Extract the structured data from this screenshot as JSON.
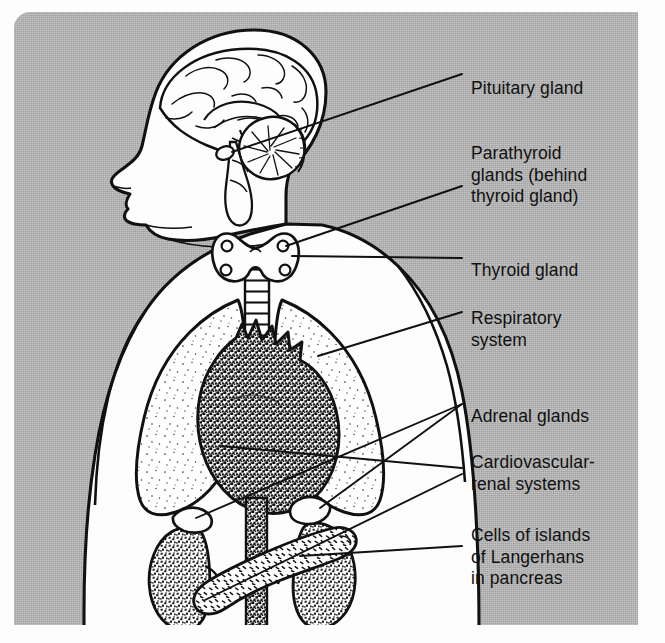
{
  "figure": {
    "panel_color": "#b2b2b2",
    "ink_color": "#101010",
    "paper_color": "#fdfdfd"
  },
  "labels": [
    {
      "id": "pituitary",
      "name": "pituitary-gland-label",
      "lines": [
        "Pituitary gland"
      ],
      "x": 471,
      "y": 78
    },
    {
      "id": "parathyroid",
      "name": "parathyroid-glands-label",
      "lines": [
        "Parathyroid",
        "glands (behind",
        "thyroid gland)"
      ],
      "x": 471,
      "y": 143
    },
    {
      "id": "thyroid",
      "name": "thyroid-gland-label",
      "lines": [
        "Thyroid gland"
      ],
      "x": 471,
      "y": 260
    },
    {
      "id": "respiratory",
      "name": "respiratory-system-label",
      "lines": [
        "Respiratory",
        "system"
      ],
      "x": 471,
      "y": 308
    },
    {
      "id": "adrenal",
      "name": "adrenal-glands-label",
      "lines": [
        "Adrenal glands"
      ],
      "x": 471,
      "y": 406
    },
    {
      "id": "cardiorenal",
      "name": "cardiovascular-renal-label",
      "lines": [
        "Cardiovascular-",
        "renal systems"
      ],
      "x": 471,
      "y": 452
    },
    {
      "id": "langerhans",
      "name": "islands-of-langerhans-label",
      "lines": [
        "Cells of islands",
        "of Langerhans",
        "in pancreas"
      ],
      "x": 471,
      "y": 525
    }
  ],
  "anatomy": [
    {
      "id": "head",
      "name": "head-profile",
      "note": "Left-facing head and neck silhouette"
    },
    {
      "id": "brain",
      "name": "brain-outline",
      "note": "Cerebrum with gyri and sulci"
    },
    {
      "id": "cerebellum",
      "name": "cerebellum",
      "note": "Arbor vitae radiating lines"
    },
    {
      "id": "brainstem",
      "name": "brainstem",
      "note": "Midbrain, pons and medulla"
    },
    {
      "id": "pituitary",
      "name": "pituitary-gland",
      "note": "Small oval at base of brain"
    },
    {
      "id": "thyroid",
      "name": "thyroid-gland",
      "note": "Butterfly shaped gland on trachea"
    },
    {
      "id": "parathyroid",
      "name": "parathyroid-glands",
      "note": "Four small circles on thyroid lobes"
    },
    {
      "id": "trachea",
      "name": "trachea",
      "note": "Ringed airway descending from larynx"
    },
    {
      "id": "lungs",
      "name": "lungs",
      "note": "Left and right lung outlines, lightly stippled"
    },
    {
      "id": "heart",
      "name": "heart",
      "note": "Heavily stippled heart with great vessels"
    },
    {
      "id": "aorta",
      "name": "descending-aorta",
      "note": "Stippled vessel descending to abdomen"
    },
    {
      "id": "kidneys",
      "name": "kidneys",
      "note": "Paired stippled bean-shaped organs"
    },
    {
      "id": "adrenals",
      "name": "adrenal-glands",
      "note": "Caps sitting atop each kidney"
    },
    {
      "id": "pancreas",
      "name": "pancreas",
      "note": "Lobular gland crossing in front of the aorta"
    },
    {
      "id": "torso",
      "name": "torso-outline",
      "note": "Shoulders, arms and trunk silhouette"
    }
  ]
}
